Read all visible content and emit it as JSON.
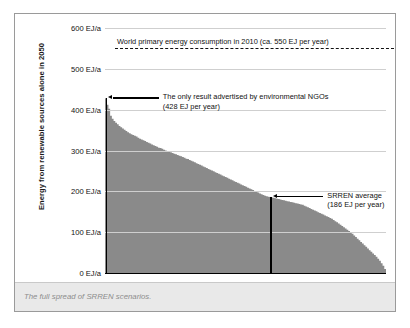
{
  "caption": "The full spread of SRREN scenarios.",
  "chart_data": {
    "type": "area",
    "title": "",
    "xlabel": "",
    "ylabel": "Energy from renewable sources alone in 2050",
    "ylim": [
      0,
      600
    ],
    "xlim": [
      0,
      164
    ],
    "grid": true,
    "legend_position": "none",
    "unit": "EJ/a",
    "series_name": "SRREN scenarios sorted descending",
    "tick_labels": [
      "0 EJ/a",
      "100 EJ/a",
      "200 EJ/a",
      "300 EJ/a",
      "400 EJ/a",
      "500 EJ/a",
      "600 EJ/a"
    ],
    "ticks": [
      0,
      100,
      200,
      300,
      400,
      500,
      600
    ],
    "values": [
      428,
      412,
      402,
      385,
      378,
      372,
      368,
      364,
      360,
      357,
      354,
      351,
      348,
      345,
      342,
      340,
      338,
      336,
      334,
      331,
      329,
      327,
      325,
      323,
      321,
      319,
      317,
      315,
      313,
      311,
      309,
      307,
      306,
      304,
      302,
      300,
      299,
      297,
      296,
      294,
      292,
      291,
      289,
      287,
      286,
      284,
      282,
      280,
      279,
      277,
      275,
      273,
      271,
      269,
      267,
      265,
      263,
      261,
      259,
      257,
      255,
      253,
      251,
      249,
      247,
      245,
      243,
      241,
      239,
      237,
      235,
      233,
      231,
      229,
      227,
      225,
      223,
      221,
      219,
      217,
      215,
      213,
      211,
      209,
      207,
      205,
      203,
      201,
      199,
      197,
      195,
      193,
      191,
      189,
      188,
      187,
      186,
      185,
      184,
      183,
      182,
      181,
      180,
      179,
      178,
      177,
      176,
      175,
      174,
      173,
      172,
      171,
      170,
      169,
      168,
      167,
      165,
      163,
      161,
      159,
      157,
      155,
      153,
      151,
      149,
      147,
      145,
      143,
      141,
      139,
      137,
      135,
      133,
      130,
      127,
      124,
      121,
      118,
      115,
      112,
      109,
      106,
      103,
      100,
      96,
      92,
      88,
      84,
      80,
      76,
      72,
      68,
      64,
      60,
      56,
      52,
      48,
      44,
      40,
      35,
      30,
      24,
      18,
      10
    ],
    "reference_lines": [
      {
        "name": "world-primary-energy-2010",
        "label": "World primary energy consumption in 2010 (ca. 550 EJ per year)",
        "value": 550,
        "style": "dashed",
        "color": "#111111"
      }
    ],
    "annotations": [
      {
        "name": "ngo-result",
        "line1": "The only result advertised by environmental NGOs",
        "line2": "(428 EJ per year)",
        "value": 428,
        "marker_index": 0
      },
      {
        "name": "srren-average",
        "line1": "SRREN average",
        "line2": "(186 EJ per year)",
        "value": 186,
        "marker_index": 96
      }
    ],
    "area_color": "#8a8a8a",
    "grid_color": "#cfcfcf",
    "axis_color": "#000000"
  }
}
